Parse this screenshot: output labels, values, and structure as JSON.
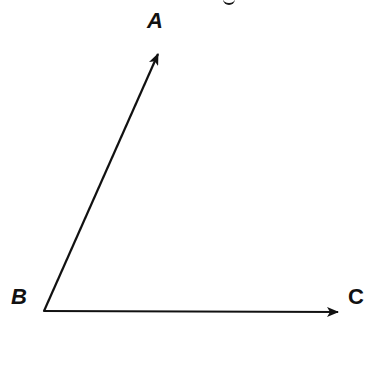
{
  "diagram": {
    "type": "angle",
    "title_fragment": "g",
    "vertex": {
      "label": "B",
      "x": 44,
      "y": 311
    },
    "rays": [
      {
        "name": "BA",
        "from": "B",
        "to": "A",
        "label": "A",
        "tip": {
          "x": 160,
          "y": 49
        }
      },
      {
        "name": "BC",
        "from": "B",
        "to": "C",
        "label": "C",
        "tip": {
          "x": 342,
          "y": 312
        }
      }
    ],
    "labels": {
      "a": "A",
      "b": "B",
      "c": "C"
    },
    "colors": {
      "stroke": "#111111",
      "background": "#ffffff"
    }
  }
}
